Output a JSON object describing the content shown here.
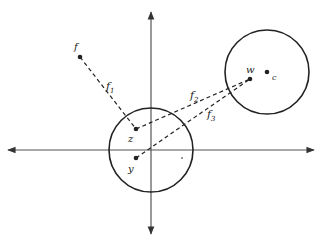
{
  "diagram": {
    "type": "geometric-diagram",
    "colors": {
      "ink": "#222222",
      "axis": "#555555",
      "background": "#ffffff"
    },
    "axes": {
      "origin": [
        151,
        150
      ],
      "x_axis": {
        "from": [
          8,
          150
        ],
        "to": [
          314,
          150
        ],
        "arrows": "both"
      },
      "y_axis": {
        "from": [
          151,
          12
        ],
        "to": [
          151,
          234
        ],
        "arrows": "both"
      }
    },
    "circles": [
      {
        "id": "lower-circle",
        "cx": 151,
        "cy": 150,
        "r": 42
      },
      {
        "id": "upper-circle",
        "cx": 267,
        "cy": 72,
        "r": 42
      }
    ],
    "points": [
      {
        "id": "f",
        "label": "f",
        "x": 80,
        "y": 57,
        "label_x": 74,
        "label_y": 50
      },
      {
        "id": "z",
        "label": "z",
        "x": 136,
        "y": 129,
        "label_x": 128,
        "label_y": 142
      },
      {
        "id": "y",
        "label": "y",
        "x": 136,
        "y": 158,
        "label_x": 128,
        "label_y": 172
      },
      {
        "id": "w",
        "label": "w",
        "x": 250,
        "y": 79,
        "label_x": 246,
        "label_y": 73
      },
      {
        "id": "c",
        "label": "c",
        "x": 267,
        "y": 72,
        "label_x": 272,
        "label_y": 80
      }
    ],
    "segments": [
      {
        "id": "f1",
        "label": "f",
        "subscript": "1",
        "from": "f",
        "to": "z",
        "label_x": 106,
        "label_y": 90
      },
      {
        "id": "f2",
        "label": "f",
        "subscript": "2",
        "from": "z",
        "to": "w",
        "label_x": 190,
        "label_y": 99
      },
      {
        "id": "f3",
        "label": "f",
        "subscript": "3",
        "from": "y",
        "to": "w",
        "label_x": 207,
        "label_y": 118
      }
    ],
    "marks": [
      {
        "id": "speck",
        "x": 182,
        "y": 158
      }
    ]
  }
}
